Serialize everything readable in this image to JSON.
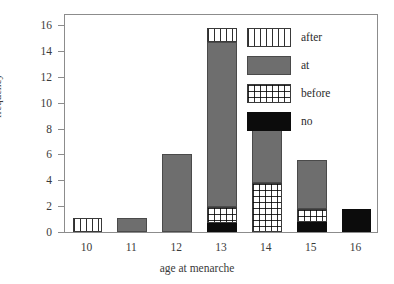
{
  "chart_data": {
    "type": "bar",
    "subtype": "stacked-bar",
    "title": "",
    "xlabel": "age at menarche",
    "ylabel": "frequency",
    "categories": [
      "10",
      "11",
      "12",
      "13",
      "14",
      "15",
      "16"
    ],
    "ylim": [
      0,
      16
    ],
    "yticks": [
      0,
      2,
      4,
      6,
      8,
      10,
      12,
      14,
      16
    ],
    "ytick_labels": [
      "0",
      "2",
      "4",
      "6",
      "8",
      "10",
      "12",
      "14",
      "16"
    ],
    "grid": false,
    "legend_position": "top-right-inside",
    "stack_order_bottom_to_top": [
      "no",
      "before",
      "at",
      "after"
    ],
    "series": [
      {
        "name": "no",
        "fill": "solid-black",
        "color": "#0c0c0c",
        "values": [
          0,
          0,
          0,
          0.7,
          0,
          0.8,
          1.8
        ]
      },
      {
        "name": "before",
        "fill": "cross-hatch-grid",
        "color": "#2f2f2f",
        "values": [
          0,
          0,
          0,
          1.2,
          3.8,
          1.0,
          0
        ]
      },
      {
        "name": "at",
        "fill": "solid-gray",
        "color": "#6e6e6e",
        "values": [
          0,
          1.1,
          6.0,
          12.8,
          5.1,
          3.8,
          0
        ]
      },
      {
        "name": "after",
        "fill": "vertical-stripes",
        "color": "#2f2f2f",
        "values": [
          1.1,
          0,
          0,
          1.1,
          0,
          0,
          0
        ]
      }
    ],
    "bar_totals": [
      1.1,
      1.1,
      6.0,
      15.8,
      8.9,
      5.6,
      1.8
    ]
  },
  "legend": {
    "entries": [
      {
        "label": "after",
        "fill": "vertical-stripes"
      },
      {
        "label": "at",
        "fill": "solid-gray"
      },
      {
        "label": "before",
        "fill": "cross-hatch-grid"
      },
      {
        "label": "no",
        "fill": "solid-black"
      }
    ]
  },
  "colors": {
    "at": "#6e6e6e",
    "no": "#0c0c0c",
    "hatch": "#2f2f2f",
    "axis": "#8c8c8c",
    "text": "#2b2b2b",
    "background": "#ffffff"
  },
  "caption": {
    "top_clipped_text": ""
  }
}
